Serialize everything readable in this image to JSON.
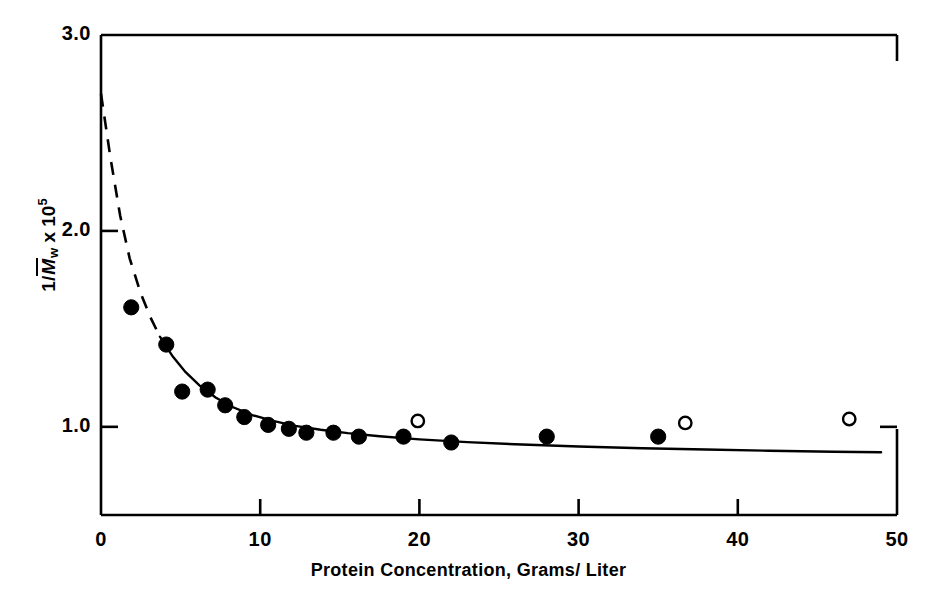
{
  "chart_data": {
    "type": "scatter",
    "title": "",
    "xlabel": "Protein Concentration, Grams/ Liter",
    "ylabel": "1/M̄w x 10⁵",
    "ylabel_parts": {
      "prefix": "1/",
      "symbol": "M",
      "subscript": "w",
      "times": " x 10",
      "exponent": "5"
    },
    "xlim": [
      0,
      50
    ],
    "ylim": [
      0.55,
      3.0
    ],
    "grid": false,
    "legend": false,
    "xticks": [
      0,
      10,
      20,
      30,
      40,
      50
    ],
    "xtick_labels": [
      "0",
      "10",
      "20",
      "30",
      "40",
      "50"
    ],
    "yticks": [
      1.0,
      2.0,
      3.0
    ],
    "ytick_labels": [
      "1.0",
      "2.0",
      "3.0"
    ],
    "series": [
      {
        "name": "filled-circles",
        "marker": "filled-circle",
        "color": "#000000",
        "points": [
          {
            "x": 1.9,
            "y": 1.61
          },
          {
            "x": 4.1,
            "y": 1.42
          },
          {
            "x": 5.1,
            "y": 1.18
          },
          {
            "x": 6.7,
            "y": 1.19
          },
          {
            "x": 7.8,
            "y": 1.11
          },
          {
            "x": 9.0,
            "y": 1.05
          },
          {
            "x": 10.5,
            "y": 1.01
          },
          {
            "x": 11.8,
            "y": 0.99
          },
          {
            "x": 12.9,
            "y": 0.97
          },
          {
            "x": 14.6,
            "y": 0.97
          },
          {
            "x": 16.2,
            "y": 0.95
          },
          {
            "x": 19.0,
            "y": 0.95
          },
          {
            "x": 22.0,
            "y": 0.92
          },
          {
            "x": 28.0,
            "y": 0.95
          },
          {
            "x": 35.0,
            "y": 0.95
          }
        ]
      },
      {
        "name": "open-circles",
        "marker": "open-circle",
        "color": "#000000",
        "points": [
          {
            "x": 19.9,
            "y": 1.03
          },
          {
            "x": 36.7,
            "y": 1.02
          },
          {
            "x": 47.0,
            "y": 1.04
          }
        ]
      }
    ],
    "curve": {
      "name": "fitted-curve",
      "dashed_segment": {
        "x_start": 0.0,
        "x_end": 3.7
      },
      "solid_segment": {
        "x_start": 3.7,
        "x_end": 49.0
      },
      "points": [
        {
          "x": 0.0,
          "y": 2.7
        },
        {
          "x": 0.6,
          "y": 2.37
        },
        {
          "x": 1.2,
          "y": 2.08
        },
        {
          "x": 1.8,
          "y": 1.86
        },
        {
          "x": 2.5,
          "y": 1.68
        },
        {
          "x": 3.1,
          "y": 1.56
        },
        {
          "x": 3.7,
          "y": 1.46
        },
        {
          "x": 4.5,
          "y": 1.36
        },
        {
          "x": 5.3,
          "y": 1.28
        },
        {
          "x": 6.2,
          "y": 1.21
        },
        {
          "x": 7.2,
          "y": 1.15
        },
        {
          "x": 8.3,
          "y": 1.1
        },
        {
          "x": 9.5,
          "y": 1.06
        },
        {
          "x": 10.8,
          "y": 1.03
        },
        {
          "x": 12.2,
          "y": 1.005
        },
        {
          "x": 13.8,
          "y": 0.985
        },
        {
          "x": 15.5,
          "y": 0.968
        },
        {
          "x": 17.5,
          "y": 0.952
        },
        {
          "x": 20.0,
          "y": 0.936
        },
        {
          "x": 23.0,
          "y": 0.922
        },
        {
          "x": 26.0,
          "y": 0.911
        },
        {
          "x": 30.0,
          "y": 0.9
        },
        {
          "x": 34.0,
          "y": 0.891
        },
        {
          "x": 38.0,
          "y": 0.884
        },
        {
          "x": 42.0,
          "y": 0.878
        },
        {
          "x": 46.0,
          "y": 0.873
        },
        {
          "x": 49.0,
          "y": 0.87
        }
      ]
    },
    "axis_frame": {
      "left": 101,
      "right": 897,
      "top": 35,
      "bottom": 515,
      "color": "#000000"
    }
  },
  "axis_labels": {
    "x": [
      {
        "text": "0",
        "value": 0
      },
      {
        "text": "10",
        "value": 10
      },
      {
        "text": "20",
        "value": 20
      },
      {
        "text": "30",
        "value": 30
      },
      {
        "text": "40",
        "value": 40
      },
      {
        "text": "50",
        "value": 50
      }
    ],
    "y": [
      {
        "text": "1.0",
        "value": 1.0
      },
      {
        "text": "2.0",
        "value": 2.0
      },
      {
        "text": "3.0",
        "value": 3.0
      }
    ]
  },
  "titles": {
    "x_axis": "Protein Concentration, Grams/ Liter",
    "y_prefix": "1/",
    "y_symbol": "M",
    "y_subscript": "w",
    "y_times": "x 10",
    "y_exponent": "5"
  }
}
